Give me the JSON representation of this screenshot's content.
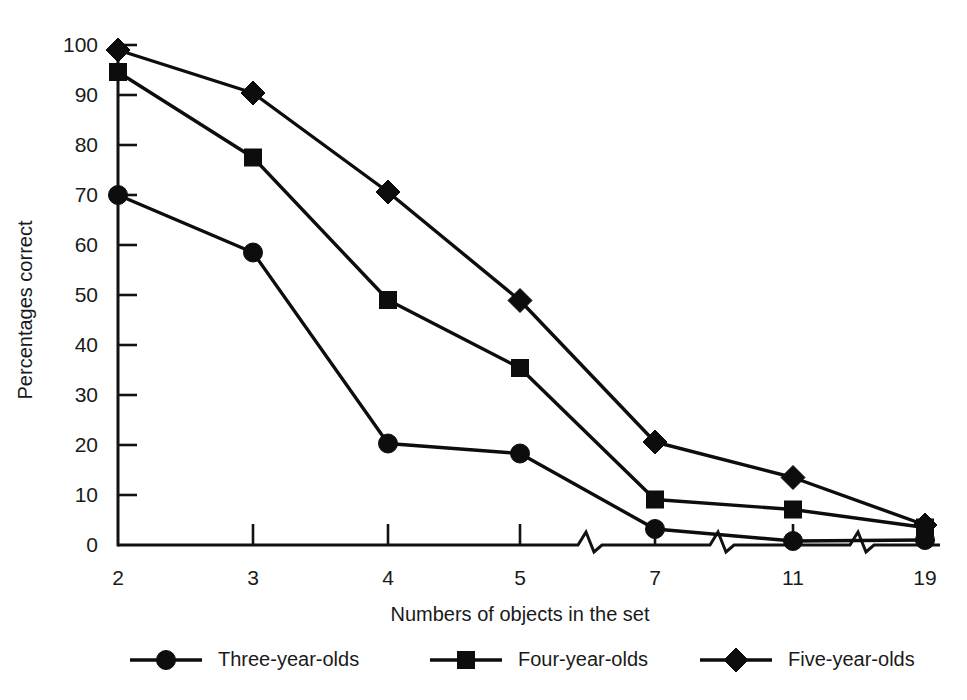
{
  "chart_data": {
    "type": "line",
    "title": "",
    "xlabel": "Numbers of objects in the set",
    "ylabel": "Percentages correct",
    "categories": [
      "2",
      "3",
      "4",
      "5",
      "7",
      "11",
      "19"
    ],
    "x_tick_labels": [
      "2",
      "3",
      "4",
      "5",
      "7",
      "11",
      "19"
    ],
    "y_tick_labels": [
      "0",
      "10",
      "20",
      "30",
      "40",
      "50",
      "60",
      "70",
      "80",
      "90",
      "100"
    ],
    "y_ticks": [
      0,
      10,
      20,
      30,
      40,
      50,
      60,
      70,
      80,
      90,
      100
    ],
    "ylim": [
      0,
      100
    ],
    "grid": false,
    "legend_position": "bottom",
    "axis_breaks": [
      "between 5 and 7",
      "between 7 and 11",
      "between 11 and 19"
    ],
    "series": [
      {
        "name": "Three-year-olds",
        "marker": "circle",
        "color": "#0d0d0d",
        "values": [
          70,
          58.5,
          20.3,
          18.3,
          3.2,
          0.8,
          1.0
        ]
      },
      {
        "name": "Four-year-olds",
        "marker": "square",
        "color": "#0d0d0d",
        "values": [
          94.6,
          77.5,
          49,
          35.4,
          9.1,
          7.1,
          3.5
        ]
      },
      {
        "name": "Five-year-olds",
        "marker": "diamond",
        "color": "#0d0d0d",
        "values": [
          99,
          90.4,
          70.6,
          48.9,
          20.6,
          13.5,
          4.0
        ]
      }
    ]
  },
  "legend": {
    "items": [
      {
        "label": "Three-year-olds",
        "marker": "circle"
      },
      {
        "label": "Four-year-olds",
        "marker": "square"
      },
      {
        "label": "Five-year-olds",
        "marker": "diamond"
      }
    ]
  }
}
